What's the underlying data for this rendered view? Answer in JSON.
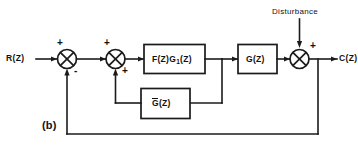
{
  "figure": {
    "label": "(b)",
    "type": "control-system-block-diagram"
  },
  "signals": {
    "input": "R(Z)",
    "output": "C(Z)",
    "disturbance": "Disturbance"
  },
  "blocks": [
    {
      "id": "forward-1",
      "label_main": "F(Z)G",
      "label_sub": "1",
      "label_tail": "(Z)",
      "full": "F(Z)G1(Z)"
    },
    {
      "id": "forward-2",
      "label_main": "G(Z)",
      "label_sub": "",
      "label_tail": "",
      "full": "G(Z)"
    },
    {
      "id": "inner-feedback",
      "label_main": "G",
      "label_sub": "",
      "label_tail": "(Z)",
      "full": "G-bar(Z)"
    }
  ],
  "summing_junctions": [
    {
      "id": "sum-outer",
      "signs": [
        {
          "position": "top-input",
          "sign": "+"
        },
        {
          "position": "bottom-feedback",
          "sign": "-"
        }
      ]
    },
    {
      "id": "sum-inner",
      "signs": [
        {
          "position": "top-input",
          "sign": "+"
        },
        {
          "position": "bottom-feedback",
          "sign": "+"
        }
      ]
    },
    {
      "id": "sum-disturbance",
      "signs": [
        {
          "position": "top-right",
          "sign": "+"
        }
      ]
    }
  ],
  "colors": {
    "line": "#1b1b1b",
    "background": "#ffffff",
    "text": "#111111"
  }
}
